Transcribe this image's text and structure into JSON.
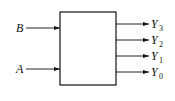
{
  "diagram": {
    "type": "logic-block",
    "block": {
      "x": 60,
      "y": 12,
      "width": 56,
      "height": 73
    },
    "inputs": [
      {
        "name": "B",
        "y": 28
      },
      {
        "name": "A",
        "y": 69
      }
    ],
    "outputs": [
      {
        "name": "Y",
        "sub": "3",
        "y": 24
      },
      {
        "name": "Y",
        "sub": "2",
        "y": 40
      },
      {
        "name": "Y",
        "sub": "1",
        "y": 56
      },
      {
        "name": "Y",
        "sub": "0",
        "y": 72
      }
    ],
    "colors": {
      "line": "#111111",
      "background": "#ffffff"
    }
  }
}
